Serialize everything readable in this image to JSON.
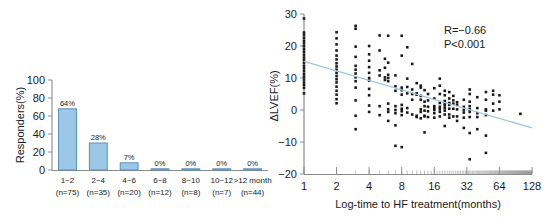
{
  "figure": {
    "background": "#ffffff",
    "panels": [
      "bar-chart-panel",
      "scatter-plot-panel"
    ]
  },
  "chart_data": [
    {
      "id": "responders-bar-chart",
      "type": "bar",
      "title": "",
      "xlabel": "",
      "ylabel": "Responders(%)",
      "ylim": [
        0,
        100
      ],
      "yticks": [
        0,
        20,
        40,
        60,
        80,
        100
      ],
      "ytick_labels": [
        "0",
        "20",
        "40",
        "60",
        "80",
        "100"
      ],
      "grid": false,
      "legend": "none",
      "bar_color": "#9cc8e8",
      "bar_edge_color": "#4e89b8",
      "categories": [
        "1~2",
        "2~4",
        "4~6",
        "6~8",
        "8~10",
        "10~12",
        ">12 month"
      ],
      "category_sublabels": [
        "(n=75)",
        "(n=35)",
        "(n=20)",
        "(n=12)",
        "(n=8)",
        "(n=7)",
        "(n=44)"
      ],
      "n_values": [
        75,
        35,
        20,
        12,
        8,
        7,
        44
      ],
      "values": [
        68,
        30,
        8,
        0.6,
        0.6,
        0.6,
        0.6
      ],
      "data_labels": [
        "64%",
        "28%",
        "7%",
        "0%",
        "0%",
        "0%",
        "0%"
      ]
    },
    {
      "id": "lvef-vs-logtime-scatter",
      "type": "scatter",
      "title": "",
      "xlabel": "Log-time to HF treatment(months)",
      "ylabel": "ΔLVEF(%)",
      "xscale": "log2",
      "xlim": [
        1,
        128
      ],
      "ylim": [
        -20,
        30
      ],
      "xticks": [
        1,
        2,
        4,
        8,
        16,
        32,
        64,
        128
      ],
      "xtick_labels": [
        "1",
        "2",
        "4",
        "8",
        "16",
        "32",
        "64",
        "128"
      ],
      "yticks": [
        -20,
        -10,
        0,
        10,
        20,
        30
      ],
      "ytick_labels": [
        "−20",
        "−10",
        "0",
        "10",
        "20",
        "30"
      ],
      "grid": false,
      "legend": "none",
      "point_color": "#1a1a1a",
      "point_marker": "square",
      "regression_line": {
        "color": "#9fc6de",
        "x_start": 1,
        "y_start": 15.2,
        "x_end": 128,
        "y_end": -5.6
      },
      "annotations": [
        {
          "name": "correlation-coefficient",
          "text": "R=−0.66",
          "x": 32,
          "y": 24
        },
        {
          "name": "p-value",
          "text": "P<0.001",
          "x": 32,
          "y": 20.5
        }
      ],
      "points": [
        [
          1,
          28.6
        ],
        [
          1,
          24.2
        ],
        [
          1,
          23.4
        ],
        [
          1,
          22.5
        ],
        [
          1,
          21.6
        ],
        [
          1,
          20.8
        ],
        [
          1,
          19.9
        ],
        [
          1,
          19.0
        ],
        [
          1,
          18.2
        ],
        [
          1,
          17.3
        ],
        [
          1,
          16.4
        ],
        [
          1,
          15.6
        ],
        [
          1,
          14.7
        ],
        [
          1,
          13.8
        ],
        [
          1,
          13.0
        ],
        [
          1,
          12.1
        ],
        [
          1,
          11.2
        ],
        [
          1,
          10.4
        ],
        [
          1,
          9.5
        ],
        [
          1,
          8.6
        ],
        [
          1,
          7.8
        ],
        [
          1,
          6.9
        ],
        [
          1,
          5.2
        ],
        [
          2,
          24.3
        ],
        [
          2,
          22.4
        ],
        [
          2,
          20.5
        ],
        [
          2,
          18.6
        ],
        [
          2,
          17.0
        ],
        [
          2,
          15.8
        ],
        [
          2,
          14.6
        ],
        [
          2,
          13.6
        ],
        [
          2,
          12.6
        ],
        [
          2,
          11.6
        ],
        [
          2,
          10.6
        ],
        [
          2,
          9.6
        ],
        [
          2,
          8.6
        ],
        [
          2,
          7.3
        ],
        [
          2,
          6.0
        ],
        [
          2,
          4.8
        ],
        [
          2,
          3.4
        ],
        [
          2,
          2.1
        ],
        [
          3,
          26.3
        ],
        [
          3,
          25.4
        ],
        [
          3,
          19.8
        ],
        [
          3,
          16.6
        ],
        [
          3,
          13.8
        ],
        [
          3,
          12.6
        ],
        [
          3,
          11.4
        ],
        [
          3,
          10.2
        ],
        [
          3,
          9.0
        ],
        [
          3,
          7.0
        ],
        [
          3,
          3.0
        ],
        [
          3,
          -1.8
        ],
        [
          3,
          -6.0
        ],
        [
          4,
          20.0
        ],
        [
          4,
          17.4
        ],
        [
          4,
          15.4
        ],
        [
          4,
          13.4
        ],
        [
          4,
          11.6
        ],
        [
          4,
          10.0
        ],
        [
          4,
          9.2
        ],
        [
          4,
          6.6
        ],
        [
          4,
          4.6
        ],
        [
          4,
          1.4
        ],
        [
          4,
          -0.6
        ],
        [
          5,
          23.3
        ],
        [
          5,
          18.6
        ],
        [
          5,
          12.4
        ],
        [
          5,
          10.8
        ],
        [
          5,
          1.2
        ],
        [
          5,
          -1.6
        ],
        [
          5.6,
          16.0
        ],
        [
          5.6,
          13.2
        ],
        [
          5.6,
          10.2
        ],
        [
          5.6,
          9.4
        ],
        [
          6,
          23.2
        ],
        [
          6,
          14.8
        ],
        [
          6,
          11.0
        ],
        [
          6,
          10.0
        ],
        [
          6,
          9.0
        ],
        [
          6,
          2.0
        ],
        [
          6,
          0.2
        ],
        [
          6,
          -0.6
        ],
        [
          6,
          -3.4
        ],
        [
          7,
          10.8
        ],
        [
          7,
          7.4
        ],
        [
          7,
          6.0
        ],
        [
          7,
          1.2
        ],
        [
          7,
          0.0
        ],
        [
          7,
          -1.0
        ],
        [
          7,
          -4.8
        ],
        [
          7,
          -11.2
        ],
        [
          8,
          23.2
        ],
        [
          8,
          17.0
        ],
        [
          8,
          7.0
        ],
        [
          8,
          6.2
        ],
        [
          8,
          4.8
        ],
        [
          8,
          1.6
        ],
        [
          8,
          0.4
        ],
        [
          8,
          -0.4
        ],
        [
          8,
          -1.6
        ],
        [
          8,
          -11.6
        ],
        [
          9,
          19.6
        ],
        [
          9,
          9.8
        ],
        [
          9,
          7.2
        ],
        [
          9,
          5.2
        ],
        [
          9,
          0.6
        ],
        [
          9,
          -0.8
        ],
        [
          10,
          14.4
        ],
        [
          10,
          6.4
        ],
        [
          10,
          5.0
        ],
        [
          10,
          3.2
        ],
        [
          10,
          -1.4
        ],
        [
          11,
          8.4
        ],
        [
          11,
          5.2
        ],
        [
          11,
          4.8
        ],
        [
          11,
          -1.8
        ],
        [
          11,
          -2.2
        ],
        [
          12,
          7.6
        ],
        [
          12,
          7.0
        ],
        [
          12,
          4.4
        ],
        [
          12,
          3.2
        ],
        [
          12,
          0.2
        ],
        [
          12,
          -0.6
        ],
        [
          12,
          -2.6
        ],
        [
          13,
          6.2
        ],
        [
          13,
          2.6
        ],
        [
          13,
          1.2
        ],
        [
          13,
          -0.2
        ],
        [
          13,
          -1.8
        ],
        [
          13,
          -2.0
        ],
        [
          13,
          -7.0
        ],
        [
          14,
          5.0
        ],
        [
          14,
          3.0
        ],
        [
          14,
          1.0
        ],
        [
          14,
          -0.4
        ],
        [
          14,
          -2.2
        ],
        [
          16,
          6.8
        ],
        [
          16,
          3.6
        ],
        [
          16,
          1.2
        ],
        [
          16,
          0.6
        ],
        [
          16,
          0.0
        ],
        [
          16,
          -1.0
        ],
        [
          16,
          -2.4
        ],
        [
          18,
          9.8
        ],
        [
          18,
          7.6
        ],
        [
          18,
          5.0
        ],
        [
          18,
          2.2
        ],
        [
          18,
          1.0
        ],
        [
          18,
          0.2
        ],
        [
          18,
          -0.6
        ],
        [
          18,
          -2.0
        ],
        [
          20,
          6.0
        ],
        [
          20,
          4.6
        ],
        [
          20,
          2.8
        ],
        [
          20,
          2.0
        ],
        [
          20,
          1.4
        ],
        [
          20,
          0.6
        ],
        [
          20,
          -0.2
        ],
        [
          20,
          -1.4
        ],
        [
          20,
          -5.0
        ],
        [
          22,
          5.6
        ],
        [
          22,
          3.6
        ],
        [
          22,
          2.2
        ],
        [
          22,
          1.6
        ],
        [
          22,
          0.4
        ],
        [
          22,
          -1.4
        ],
        [
          22,
          -2.4
        ],
        [
          24,
          4.4
        ],
        [
          24,
          3.0
        ],
        [
          24,
          2.0
        ],
        [
          24,
          0.4
        ],
        [
          24,
          -2.0
        ],
        [
          26,
          2.4
        ],
        [
          26,
          1.6
        ],
        [
          26,
          0.2
        ],
        [
          26,
          -2.0
        ],
        [
          26,
          -3.4
        ],
        [
          30,
          3.2
        ],
        [
          30,
          1.0
        ],
        [
          30,
          0.0
        ],
        [
          30,
          -0.8
        ],
        [
          30,
          -2.4
        ],
        [
          30,
          -5.6
        ],
        [
          34,
          6.4
        ],
        [
          34,
          5.0
        ],
        [
          34,
          2.6
        ],
        [
          34,
          1.2
        ],
        [
          34,
          0.2
        ],
        [
          34,
          -0.6
        ],
        [
          34,
          -2.2
        ],
        [
          34,
          -7.2
        ],
        [
          34,
          -15.4
        ],
        [
          40,
          4.0
        ],
        [
          40,
          0.6
        ],
        [
          40,
          -1.0
        ],
        [
          40,
          -2.2
        ],
        [
          40,
          -6.0
        ],
        [
          48,
          5.6
        ],
        [
          48,
          3.2
        ],
        [
          48,
          0.2
        ],
        [
          48,
          -0.2
        ],
        [
          48,
          -1.6
        ],
        [
          48,
          -8.0
        ],
        [
          48,
          -13.4
        ],
        [
          56,
          6.0
        ],
        [
          56,
          4.8
        ],
        [
          56,
          2.0
        ],
        [
          56,
          -0.2
        ],
        [
          64,
          4.6
        ],
        [
          64,
          2.6
        ],
        [
          64,
          0.2
        ],
        [
          100,
          -1.2
        ]
      ]
    }
  ]
}
